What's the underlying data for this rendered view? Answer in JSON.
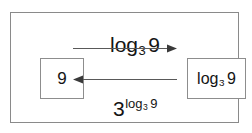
{
  "diagram": {
    "type": "inverse-function-mapping",
    "nodes": [
      {
        "id": "input",
        "label_base": "9",
        "label_text": "9"
      },
      {
        "id": "output",
        "label_base": "log",
        "label_sub": "3",
        "label_arg": "9",
        "label_text": "log_3 9"
      }
    ],
    "edges": [
      {
        "id": "forward",
        "direction": "right",
        "label_base": "log",
        "label_sub": "3",
        "label_arg": "9",
        "label_text": "log_3 9"
      },
      {
        "id": "backward",
        "direction": "left",
        "label_base": "3",
        "label_exp_base": "log",
        "label_exp_sub": "3",
        "label_exp_arg": "9",
        "label_text": "3^(log_3 9)"
      }
    ],
    "colors": {
      "frame_border": "#8a8a8a",
      "box_border": "#8d8d8d",
      "text": "#141414",
      "arrow": "#595959",
      "background": "#ffffff"
    }
  }
}
